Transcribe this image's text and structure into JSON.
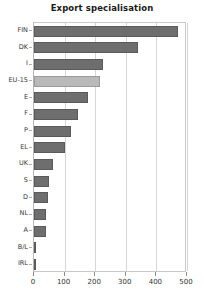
{
  "chart_data": {
    "type": "bar",
    "orientation": "horizontal",
    "title": "Export specialisation",
    "xlabel": "",
    "ylabel": "",
    "categories": [
      "FIN",
      "DK",
      "I",
      "EU-15",
      "E",
      "F",
      "P",
      "EL",
      "UK",
      "S",
      "D",
      "NL",
      "A",
      "B/L",
      "IRL"
    ],
    "values": [
      470,
      340,
      225,
      215,
      175,
      145,
      122,
      102,
      62,
      50,
      46,
      40,
      38,
      5,
      3
    ],
    "xlim": [
      0,
      500
    ],
    "xticks": [
      0,
      100,
      200,
      300,
      400,
      500
    ],
    "xtick_labels": [
      "0",
      "100",
      "200",
      "300",
      "400",
      "500"
    ],
    "grid": true,
    "gridline_axis": "x",
    "legend": null,
    "highlight_category": "EU-15",
    "colors": {
      "bar": "#6e6e6e",
      "bar_border": "#5a5a5a",
      "bar_highlight": "#b9b9b9",
      "bar_highlight_border": "#9a9a9a",
      "gridline": "#d6d6d6",
      "axis": "#b0b0b0",
      "plot_background": "#ffffff",
      "text": "#333333",
      "title": "#1a1a1a"
    }
  }
}
